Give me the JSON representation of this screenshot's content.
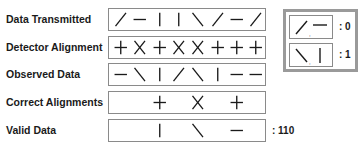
{
  "rows": [
    {
      "label": "Data Transmitted",
      "symbols": [
        "slash",
        "dash",
        "bar",
        "bar",
        "backslash",
        "slash",
        "dash",
        "slash"
      ]
    },
    {
      "label": "Detector Alignment",
      "symbols": [
        "plus",
        "cross",
        "plus",
        "cross",
        "cross",
        "plus",
        "plus",
        "plus"
      ]
    },
    {
      "label": "Observed Data",
      "symbols": [
        "dash",
        "backslash",
        "bar",
        "slash",
        "backslash",
        "bar",
        "dash",
        "dash"
      ]
    },
    {
      "label": "Correct Alignments",
      "symbols": [
        "",
        "",
        "plus",
        "",
        "cross",
        "",
        "plus",
        ""
      ]
    },
    {
      "label": "Valid Data",
      "symbols": [
        "",
        "",
        "bar",
        "",
        "backslash",
        "",
        "dash",
        ""
      ],
      "value": ": 110"
    }
  ],
  "legend": {
    "entries": [
      {
        "symbols": [
          "slash",
          "dash"
        ],
        "separator": ",",
        "value": ": 0"
      },
      {
        "symbols": [
          "backslash",
          "bar"
        ],
        "separator": ",",
        "value": ": 1"
      }
    ]
  },
  "colors": {
    "stroke": "#1a1a1a",
    "box_border": "#8a8a8a",
    "legend_border": "#9a9a9a"
  }
}
